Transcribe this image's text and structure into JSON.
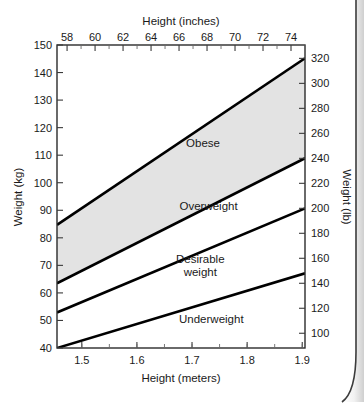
{
  "chart_data": {
    "type": "line",
    "title": "",
    "subtitle": "",
    "xlabel": "Height (meters)",
    "ylabel": "Weight (kg)",
    "xlabel_top": "Height (inches)",
    "ylabel_right": "Weight (lb)",
    "xlim": [
      1.455,
      1.905
    ],
    "ylim": [
      40,
      150
    ],
    "xlim_top_inches": [
      57.28,
      75.0
    ],
    "ylim_right_lb": [
      88.2,
      330.7
    ],
    "grid": false,
    "legend": false,
    "legend_position": "none",
    "x_ticks_meters": [
      "1.5",
      "1.6",
      "1.7",
      "1.8",
      "1.9"
    ],
    "x_tick_values_meters": [
      1.5,
      1.6,
      1.7,
      1.8,
      1.9
    ],
    "x_ticks_inches": [
      "58",
      "60",
      "62",
      "64",
      "66",
      "68",
      "70",
      "72",
      "74"
    ],
    "x_tick_values_inches": [
      58,
      60,
      62,
      64,
      66,
      68,
      70,
      72,
      74
    ],
    "y_ticks_kg": [
      "40",
      "50",
      "60",
      "70",
      "80",
      "90",
      "100",
      "110",
      "120",
      "130",
      "140",
      "150"
    ],
    "y_tick_values_kg": [
      40,
      50,
      60,
      70,
      80,
      90,
      100,
      110,
      120,
      130,
      140,
      150
    ],
    "y_ticks_lb": [
      "100",
      "120",
      "140",
      "160",
      "180",
      "200",
      "220",
      "240",
      "260",
      "280",
      "300",
      "320"
    ],
    "y_tick_values_lb": [
      100,
      120,
      140,
      160,
      180,
      200,
      220,
      240,
      260,
      280,
      300,
      320
    ],
    "series": [
      {
        "name": "obese-lower-boundary",
        "bmi": 40,
        "x": [
          1.455,
          1.905
        ],
        "values": [
          84.7,
          145.2
        ]
      },
      {
        "name": "overweight-lower-boundary",
        "bmi": 30,
        "x": [
          1.455,
          1.905
        ],
        "values": [
          63.5,
          108.9
        ]
      },
      {
        "name": "desirable-lower-boundary",
        "bmi": 25,
        "x": [
          1.455,
          1.905
        ],
        "values": [
          52.9,
          90.7
        ]
      },
      {
        "name": "underweight-upper-boundary",
        "bmi": 18.5,
        "x": [
          1.455,
          1.905
        ],
        "values": [
          40.0,
          67.1
        ]
      }
    ],
    "shaded_band": {
      "between": [
        "overweight-lower-boundary",
        "obese-lower-boundary"
      ],
      "color": "#e3e3e3"
    },
    "annotations": [
      {
        "text": "Obese",
        "x": 1.72,
        "y": 113,
        "name": "obese"
      },
      {
        "text": "Overweight",
        "x": 1.73,
        "y": 90,
        "name": "overweight"
      },
      {
        "text": "Desirable",
        "x": 1.715,
        "y": 71,
        "name": "desirable-line1"
      },
      {
        "text": "weight",
        "x": 1.715,
        "y": 66,
        "name": "desirable-line2"
      },
      {
        "text": "Underweight",
        "x": 1.735,
        "y": 49,
        "name": "underweight"
      }
    ]
  },
  "chart": {
    "axis_titles": {
      "left": "Weight (kg)",
      "right": "Weight (lb)",
      "top": "Height (inches)",
      "bottom": "Height (meters)"
    },
    "zones": {
      "obese": "Obese",
      "overweight": "Overweight",
      "desirable_line1": "Desirable",
      "desirable_line2": "weight",
      "underweight": "Underweight"
    },
    "colors": {
      "band_fill": "#e3e3e3",
      "line": "#000000",
      "axis": "#2b2b2b",
      "text": "#1a1a1a",
      "background": "#ffffff"
    }
  }
}
